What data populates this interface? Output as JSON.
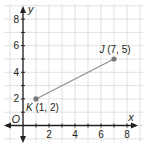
{
  "chart_data": {
    "type": "scatter",
    "title": "",
    "xlabel": "x",
    "ylabel": "y",
    "origin_label": "O",
    "xlim": [
      -0.8,
      8.8
    ],
    "ylim": [
      -0.8,
      8.8
    ],
    "x_ticks": [
      2,
      4,
      6,
      8
    ],
    "y_ticks": [
      2,
      4,
      6,
      8
    ],
    "x_tick_labels": [
      "2",
      "4",
      "6",
      "8"
    ],
    "y_tick_labels": [
      "2",
      "4",
      "6",
      "8"
    ],
    "grid": true,
    "grid_step": 1,
    "points": [
      {
        "name": "K",
        "x": 1,
        "y": 2,
        "label": "K (1, 2)"
      },
      {
        "name": "J",
        "x": 7,
        "y": 5,
        "label": "J (7, 5)"
      }
    ],
    "segments": [
      {
        "from": "K",
        "to": "J"
      }
    ],
    "colors": {
      "grid": "#d9d9d9",
      "axis": "#231f20",
      "point": "#7a7a7a",
      "segment": "#8c8c8c"
    }
  }
}
